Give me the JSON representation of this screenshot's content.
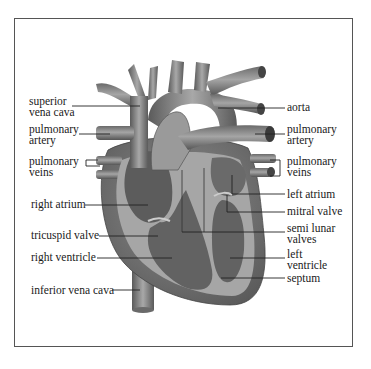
{
  "diagram": {
    "type": "labeled anatomical illustration",
    "colors": {
      "frame": "#555555",
      "vessel": "#8a8a8a",
      "chamber_dark": "#5e5e5e",
      "wall": "#a9a9a9",
      "leader_line": "#222222",
      "text": "#1a1a1a"
    },
    "labels_left": [
      {
        "id": "superior-vena-cava",
        "lines": [
          "superior",
          "vena cava"
        ]
      },
      {
        "id": "pulmonary-artery-left",
        "lines": [
          "pulmonary",
          "artery"
        ]
      },
      {
        "id": "pulmonary-veins-left",
        "lines": [
          "pulmonary",
          "veins"
        ]
      },
      {
        "id": "right-atrium",
        "lines": [
          "right atrium"
        ]
      },
      {
        "id": "tricuspid-valve",
        "lines": [
          "tricuspid valve"
        ]
      },
      {
        "id": "right-ventricle",
        "lines": [
          "right ventricle"
        ]
      },
      {
        "id": "inferior-vena-cava",
        "lines": [
          "inferior vena cava"
        ]
      }
    ],
    "labels_right": [
      {
        "id": "aorta",
        "lines": [
          "aorta"
        ]
      },
      {
        "id": "pulmonary-artery-right",
        "lines": [
          "pulmonary",
          "artery"
        ]
      },
      {
        "id": "pulmonary-veins-right",
        "lines": [
          "pulmonary",
          "veins"
        ]
      },
      {
        "id": "left-atrium",
        "lines": [
          "left atrium"
        ]
      },
      {
        "id": "mitral-valve",
        "lines": [
          "mitral valve"
        ]
      },
      {
        "id": "semi-lunar-valves",
        "lines": [
          "semi lunar",
          "valves"
        ]
      },
      {
        "id": "left-ventricle",
        "lines": [
          "left",
          "ventricle"
        ]
      },
      {
        "id": "septum",
        "lines": [
          "septum"
        ]
      }
    ]
  }
}
